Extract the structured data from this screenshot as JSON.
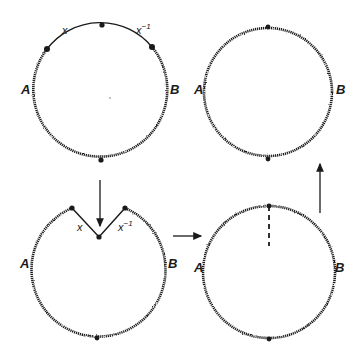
{
  "diagram": {
    "type": "topological surgery sequence",
    "colors": {
      "ink": "#1a1a1a",
      "background": "#ffffff"
    },
    "panels": [
      {
        "id": "top-left",
        "description": "circle with smooth arc split into x and x^-1, wavy arcs A and B",
        "labels": {
          "left": "A",
          "right": "B",
          "arc_left": "x",
          "arc_right": "x",
          "arc_right_sup": "−1"
        }
      },
      {
        "id": "bottom-left",
        "description": "circle with x and x^-1 arcs folded inward into a V notch",
        "labels": {
          "left": "A",
          "right": "B",
          "arc_left": "x",
          "arc_right": "x",
          "arc_right_sup": "−1"
        }
      },
      {
        "id": "bottom-right",
        "description": "notch closed into wavy circle with dashed seam from top node",
        "labels": {
          "left": "A",
          "right": "B"
        }
      },
      {
        "id": "top-right",
        "description": "resulting wavy circle with two nodes",
        "labels": {
          "left": "A",
          "right": "B"
        }
      }
    ],
    "arrows": [
      {
        "from": "top-left",
        "to": "bottom-left",
        "direction": "down"
      },
      {
        "from": "bottom-left",
        "to": "bottom-right",
        "direction": "right"
      },
      {
        "from": "bottom-right",
        "to": "top-right",
        "direction": "up"
      }
    ]
  }
}
